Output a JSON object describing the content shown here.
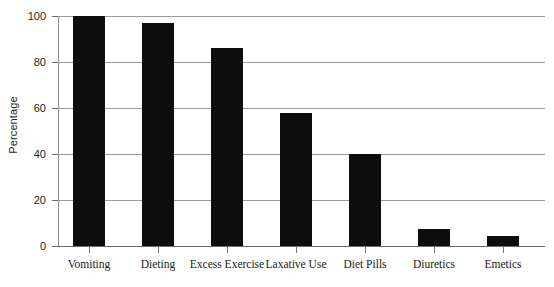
{
  "chart_data": {
    "type": "bar",
    "title": "",
    "xlabel": "",
    "ylabel": "Percentage",
    "ylim": [
      0,
      100
    ],
    "yticks": [
      0,
      20,
      40,
      60,
      80,
      100
    ],
    "ytick_labels": [
      "0",
      "20",
      "40",
      "60",
      "80",
      "100"
    ],
    "grid": true,
    "legend": null,
    "bar_color": "#0d0d0d",
    "categories": [
      "Vomiting",
      "Dieting",
      "Excess Exercise",
      "Laxative Use",
      "Diet Pills",
      "Diuretics",
      "Emetics"
    ],
    "values": [
      100,
      97,
      86,
      58,
      40,
      7.5,
      4.5
    ]
  },
  "axis": {
    "y_title": "Percentage"
  }
}
